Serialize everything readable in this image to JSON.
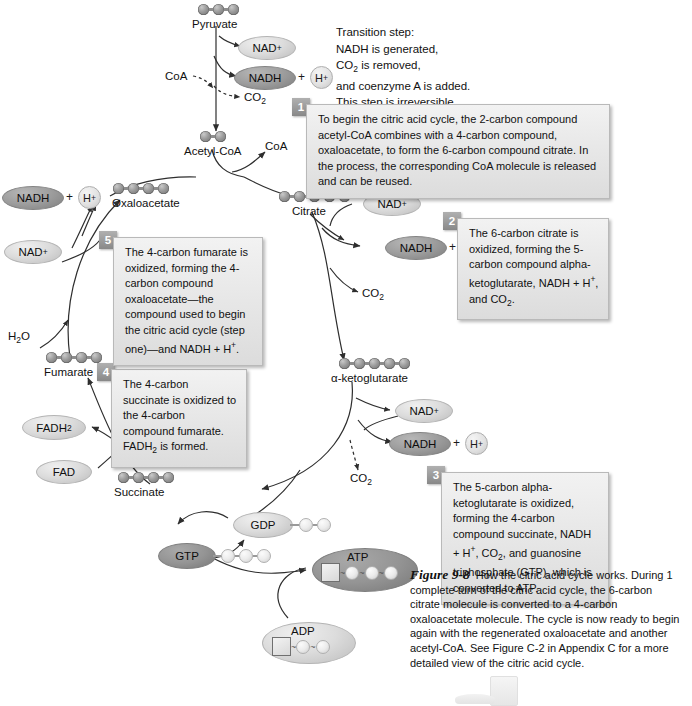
{
  "figure": {
    "number": "Figure 9-8",
    "caption": "How the citric acid cycle works. During 1 complete turn of the citric acid cycle, the 6-carbon citrate molecule is converted to a 4-carbon oxaloacetate molecule. The cycle is now ready to begin again with the regenerated oxaloacetate and another acetyl-CoA. See Figure C-2 in Appendix C for a more detailed view of the citric acid cycle."
  },
  "transition_note": {
    "lines": [
      "Transition step:",
      "NADH is generated,",
      "CO2 is removed,",
      "and coenzyme A is added.",
      "This step is irreversible."
    ],
    "line1": "Transition step:",
    "line2": "NADH is generated,",
    "line3_pre": "CO",
    "line3_sub": "2",
    "line3_post": " is removed,",
    "line4": "and coenzyme A is added.",
    "line5": "This step is irreversible."
  },
  "molecules": [
    {
      "id": "pyruvate",
      "label": "Pyruvate",
      "carbons": 3
    },
    {
      "id": "acetyl-coa",
      "label": "Acetyl-CoA",
      "carbons": 2
    },
    {
      "id": "oxaloacetate",
      "label": "Oxaloacetate",
      "carbons": 4
    },
    {
      "id": "citrate",
      "label": "Citrate",
      "carbons": 6
    },
    {
      "id": "alpha-ketoglutarate",
      "label": "α-ketoglutarate",
      "carbons": 5
    },
    {
      "id": "succinate",
      "label": "Succinate",
      "carbons": 4
    },
    {
      "id": "fumarate",
      "label": "Fumarate",
      "carbons": 4
    }
  ],
  "cofactors": {
    "nad_plus": "NAD",
    "nad_plus_sup": "+",
    "nadh": "NADH",
    "h_plus": "H",
    "h_plus_sup": "+",
    "plus_sign": "+",
    "co2": "CO",
    "co2_sub": "2",
    "coa": "CoA",
    "fad": "FAD",
    "fadh2": "FADH",
    "fadh2_sub": "2",
    "h2o": "H",
    "h2o_sub": "2",
    "h2o_post": "O",
    "gdp": "GDP",
    "gtp": "GTP",
    "atp": "ATP",
    "adp": "ADP"
  },
  "steps": [
    {
      "number": "1",
      "text": "To begin the citric acid cycle, the 2-carbon compound acetyl-CoA combines with a 4-carbon compound, oxaloacetate, to form the 6-carbon compound citrate. In the process, the corresponding CoA molecule is released and can be reused."
    },
    {
      "number": "2",
      "text": "The 6-carbon citrate is oxidized, forming the 5-carbon compound alpha-ketoglutarate, NADH + H+, and CO2."
    },
    {
      "number": "3",
      "text": "The 5-carbon alpha-ketoglutarate is oxidized, forming the 4-carbon compound succinate, NADH + H+, CO2, and guanosine triphosphate (GTP), which is converted to ATP."
    },
    {
      "number": "4",
      "text": "The 4-carbon succinate is oxidized to the 4-carbon compound fumarate. FADH2 is formed."
    },
    {
      "number": "5",
      "text": "The 4-carbon fumarate is oxidized, forming the 4-carbon compound oxaloacetate—the compound used to begin the citric acid cycle (step one)—and NADH + H+."
    }
  ],
  "colors": {
    "sphere": "#8d8d8d",
    "oval_light": "#dcdcdc",
    "oval_dark": "#9d9d9d",
    "callout_bg": "#e9e9e9",
    "badge": "#9b9b9b",
    "stroke": "#3a3a3a"
  }
}
